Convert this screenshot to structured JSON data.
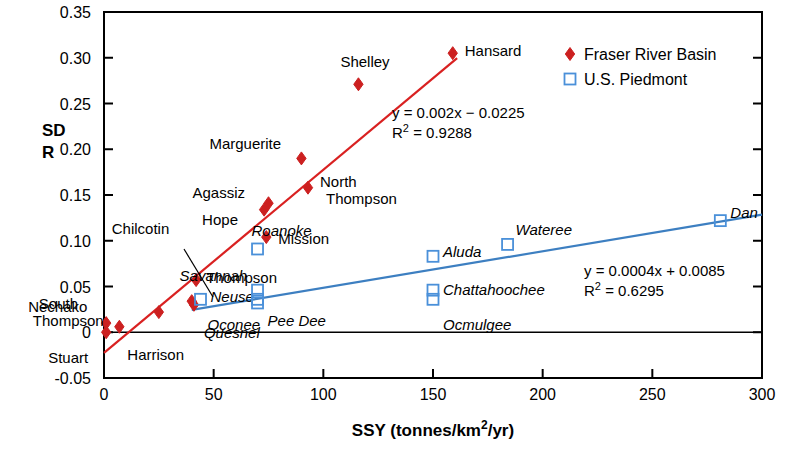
{
  "chart_data": {
    "type": "scatter",
    "title": "",
    "xlabel": "SSY (tonnes/km2/yr)",
    "xlabel_parts": {
      "main": "SSY (tonnes/km",
      "sup": "2",
      "tail": "/yr)"
    },
    "ylabel_line1": "SD",
    "ylabel_line2": "R",
    "xlim": [
      0,
      300
    ],
    "ylim": [
      -0.05,
      0.35
    ],
    "xticks": [
      "0",
      "50",
      "100",
      "150",
      "200",
      "250",
      "300"
    ],
    "xtick_values": [
      0,
      50,
      100,
      150,
      200,
      250,
      300
    ],
    "yticks": [
      "-0.05",
      "0",
      "0.05",
      "0.10",
      "0.15",
      "0.20",
      "0.25",
      "0.30",
      "0.35"
    ],
    "ytick_values": [
      -0.05,
      0,
      0.05,
      0.1,
      0.15,
      0.2,
      0.25,
      0.3,
      0.35
    ],
    "grid": false,
    "legend_position": "top-right",
    "zero_line": true,
    "series": [
      {
        "name": "Fraser River Basin",
        "marker": "filled-diamond",
        "color": "#cc2020",
        "points": [
          {
            "label": "Nechako",
            "x": 1,
            "y": 0.01,
            "label_dx": -78,
            "label_dy": -16,
            "italic": false
          },
          {
            "label": "Stuart",
            "x": 1,
            "y": 0.0,
            "label_dx": -58,
            "label_dy": 26,
            "italic": false
          },
          {
            "label": "Harrison",
            "x": 7,
            "y": 0.006,
            "label_dx": 8,
            "label_dy": 28,
            "italic": false
          },
          {
            "label": "South Thompson",
            "x": 25,
            "y": 0.022,
            "label_dx": -120,
            "label_dy": -8,
            "italic": false
          },
          {
            "label": "Chilcotin",
            "x": 40,
            "y": 0.034,
            "label_dx": -80,
            "label_dy": -72,
            "italic": false
          },
          {
            "label": "Thompson",
            "x": 42,
            "y": 0.057,
            "label_dx": 10,
            "label_dy": -2,
            "italic": false
          },
          {
            "label": "Quesnel",
            "x": 41,
            "y": 0.03,
            "label_dx": 10,
            "label_dy": 28,
            "italic": true
          },
          {
            "label": "Mission",
            "x": 74,
            "y": 0.104,
            "label_dx": 12,
            "label_dy": 2,
            "italic": false
          },
          {
            "label": "Hope",
            "x": 73,
            "y": 0.134,
            "label_dx": -62,
            "label_dy": 10,
            "italic": false
          },
          {
            "label": "Agassiz",
            "x": 75,
            "y": 0.141,
            "label_dx": -76,
            "label_dy": -10,
            "italic": false
          },
          {
            "label": "North Thompson",
            "x": 93,
            "y": 0.158,
            "label_dx": 12,
            "label_dy": -6,
            "italic": false
          },
          {
            "label": "Marguerite",
            "x": 90,
            "y": 0.19,
            "label_dx": -92,
            "label_dy": -14,
            "italic": false
          },
          {
            "label": "Shelley",
            "x": 116,
            "y": 0.271,
            "label_dx": -18,
            "label_dy": -22,
            "italic": false
          },
          {
            "label": "Hansard",
            "x": 159,
            "y": 0.305,
            "label_dx": 12,
            "label_dy": -2,
            "italic": false
          }
        ],
        "trend": {
          "equation": "y = 0.002x − 0.0225",
          "r2_label": "R",
          "r2_sup": "2",
          "r2_value": " = 0.9288",
          "slope": 0.002,
          "intercept": -0.0225,
          "x_start": 0,
          "x_end": 161
        }
      },
      {
        "name": "U.S. Piedmont",
        "marker": "open-square",
        "color": "#4a90d9",
        "points": [
          {
            "label": "Neuse",
            "x": 44,
            "y": 0.036,
            "label_dx": 10,
            "label_dy": -2,
            "italic": true
          },
          {
            "label": "Pee Dee",
            "x": 70,
            "y": 0.032,
            "label_dx": 10,
            "label_dy": 18,
            "italic": true
          },
          {
            "label": "Roanoke",
            "x": 70,
            "y": 0.091,
            "label_dx": -6,
            "label_dy": -18,
            "italic": true
          },
          {
            "label": "Savannah",
            "x": 70,
            "y": 0.046,
            "label_dx": -78,
            "label_dy": -14,
            "italic": true
          },
          {
            "label": "Oconee",
            "x": 70,
            "y": 0.036,
            "label_dx": -50,
            "label_dy": 26,
            "italic": true
          },
          {
            "label": "Aluda",
            "x": 150,
            "y": 0.083,
            "label_dx": 10,
            "label_dy": -4,
            "italic": true
          },
          {
            "label": "Chattahoochee",
            "x": 150,
            "y": 0.046,
            "label_dx": 10,
            "label_dy": 0,
            "italic": true
          },
          {
            "label": "Ocmulgee",
            "x": 150,
            "y": 0.036,
            "label_dx": 10,
            "label_dy": 26,
            "italic": true
          },
          {
            "label": "Wateree",
            "x": 184,
            "y": 0.096,
            "label_dx": 8,
            "label_dy": -14,
            "italic": true
          },
          {
            "label": "Dan",
            "x": 281,
            "y": 0.122,
            "label_dx": 10,
            "label_dy": -8,
            "italic": true
          }
        ],
        "trend": {
          "equation": "y = 0.0004x + 0.0085",
          "r2_label": "R",
          "r2_sup": "2",
          "r2_value": " = 0.6295",
          "slope": 0.0004,
          "intercept": 0.0085,
          "x_start": 40,
          "x_end": 300
        }
      }
    ]
  },
  "legend": {
    "items": [
      {
        "label": "Fraser River Basin",
        "marker": "filled-diamond",
        "color": "#cc2020"
      },
      {
        "label": "U.S. Piedmont",
        "marker": "open-square",
        "color": "#4a90d9"
      }
    ]
  }
}
